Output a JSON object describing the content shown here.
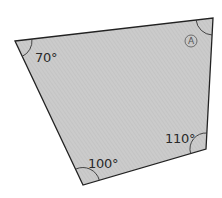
{
  "diagram": {
    "type": "quadrilateral",
    "fill_color": "#c9c9c9",
    "hatch_color": "#b8b8b8",
    "stroke_color": "#222222",
    "vertices": [
      {
        "name": "top-left",
        "x": 15,
        "y": 41,
        "angle": "70°"
      },
      {
        "name": "top-right",
        "x": 213,
        "y": 18,
        "angle": "A"
      },
      {
        "name": "bottom-right",
        "x": 206,
        "y": 149,
        "angle": "110°"
      },
      {
        "name": "bottom",
        "x": 83,
        "y": 185,
        "angle": "100°"
      }
    ],
    "labels": {
      "top_left_angle": "70°",
      "top_right_unknown": "A",
      "bottom_right_angle": "110°",
      "bottom_angle": "100°"
    }
  }
}
